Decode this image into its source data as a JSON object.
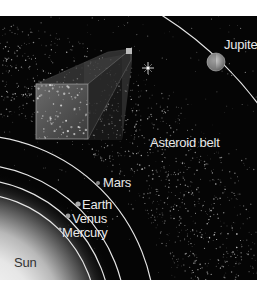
{
  "diagram": {
    "labels": {
      "sun": "Sun",
      "mercury": "Mercury",
      "venus": "Venus",
      "earth": "Earth",
      "mars": "Mars",
      "asteroid_belt": "Asteroid belt",
      "jupiter": "Jupiter"
    },
    "colors": {
      "space": "#050505",
      "orbit": "#e6e6e6",
      "label": "#e8e8e8",
      "sun_label": "#333333"
    }
  }
}
